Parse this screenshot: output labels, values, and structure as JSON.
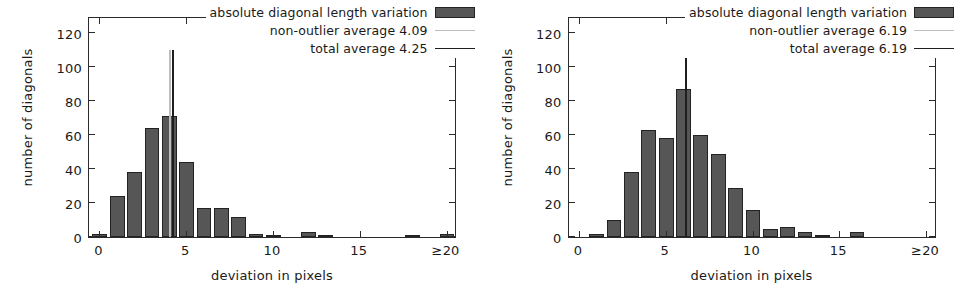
{
  "figure": {
    "panel_count": 2
  },
  "chart_data": [
    {
      "type": "bar",
      "title": "",
      "xlabel": "deviation in pixels",
      "ylabel": "number of diagonals",
      "xlim": [
        -0.6,
        20.6
      ],
      "ylim": [
        0,
        130
      ],
      "grid": false,
      "legend_position": "top-right",
      "xticks": [
        0,
        5,
        10,
        15,
        20
      ],
      "xtick_labels": [
        "0",
        "5",
        "10",
        "15",
        "≥20"
      ],
      "yticks": [
        0,
        20,
        40,
        60,
        80,
        100,
        120
      ],
      "ytick_labels": [
        "0",
        "20",
        "40",
        "60",
        "80",
        "100",
        "120"
      ],
      "bin_width": 0.85,
      "bin_starts": [
        -0.4,
        0.6,
        1.6,
        2.6,
        3.6,
        4.6,
        5.6,
        6.6,
        7.6,
        8.6,
        9.6,
        11.6,
        12.6,
        17.6,
        19.6
      ],
      "categories": [
        "0",
        "1",
        "2",
        "3",
        "4",
        "5",
        "6",
        "7",
        "8",
        "9",
        "10",
        "12",
        "13",
        "18",
        "20"
      ],
      "values": [
        2,
        24,
        38,
        64,
        71,
        44,
        17,
        17,
        12,
        2,
        1,
        3,
        1,
        1,
        2
      ],
      "series": [
        {
          "name": "absolute diagonal length variation",
          "values": [
            2,
            24,
            38,
            64,
            71,
            44,
            17,
            17,
            12,
            2,
            1,
            3,
            1,
            1,
            2
          ]
        }
      ],
      "vlines": [
        {
          "name": "non-outlier average 4.09",
          "x": 4.09,
          "color": "#bdbdbd",
          "height": 110
        },
        {
          "name": "total average 4.25",
          "x": 4.25,
          "color": "#1e1e1e",
          "height": 110
        }
      ],
      "legend": [
        {
          "label": "absolute diagonal length variation",
          "swatch": "box"
        },
        {
          "label": "non-outlier average 4.09",
          "swatch": "line-light"
        },
        {
          "label": "total average 4.25",
          "swatch": "line-dark"
        }
      ]
    },
    {
      "type": "bar",
      "title": "",
      "xlabel": "deviation in pixels",
      "ylabel": "number of diagonals",
      "xlim": [
        -0.6,
        20.6
      ],
      "ylim": [
        0,
        130
      ],
      "grid": false,
      "legend_position": "top-right",
      "xticks": [
        0,
        5,
        10,
        15,
        20
      ],
      "xtick_labels": [
        "0",
        "5",
        "10",
        "15",
        "≥20"
      ],
      "yticks": [
        0,
        20,
        40,
        60,
        80,
        100,
        120
      ],
      "ytick_labels": [
        "0",
        "20",
        "40",
        "60",
        "80",
        "100",
        "120"
      ],
      "bin_width": 0.85,
      "bin_starts": [
        0.6,
        1.6,
        2.6,
        3.6,
        4.6,
        5.6,
        6.6,
        7.6,
        8.6,
        9.6,
        10.6,
        11.6,
        12.6,
        13.6,
        15.6
      ],
      "categories": [
        "1",
        "2",
        "3",
        "4",
        "5",
        "6",
        "7",
        "8",
        "9",
        "10",
        "11",
        "12",
        "13",
        "14",
        "16"
      ],
      "values": [
        2,
        10,
        38,
        63,
        58,
        87,
        60,
        49,
        29,
        16,
        5,
        6,
        3,
        1,
        3
      ],
      "series": [
        {
          "name": "absolute diagonal length variation",
          "values": [
            2,
            10,
            38,
            63,
            58,
            87,
            60,
            49,
            29,
            16,
            5,
            6,
            3,
            1,
            3
          ]
        }
      ],
      "vlines": [
        {
          "name": "non-outlier average 6.19",
          "x": 6.19,
          "color": "#bdbdbd",
          "height": 110
        },
        {
          "name": "total average 6.19",
          "x": 6.19,
          "color": "#1e1e1e",
          "height": 110
        }
      ],
      "legend": [
        {
          "label": "absolute diagonal length variation",
          "swatch": "box"
        },
        {
          "label": "non-outlier average 6.19",
          "swatch": "line-light"
        },
        {
          "label": "total average 6.19",
          "swatch": "line-dark"
        }
      ]
    }
  ],
  "colors": {
    "bar_fill": "#565656",
    "bar_edge": "#232323",
    "axis": "#2b2b2b",
    "text": "#1a1a1a",
    "background": "#ffffff",
    "vline_light": "#bdbdbd",
    "vline_dark": "#1e1e1e"
  }
}
